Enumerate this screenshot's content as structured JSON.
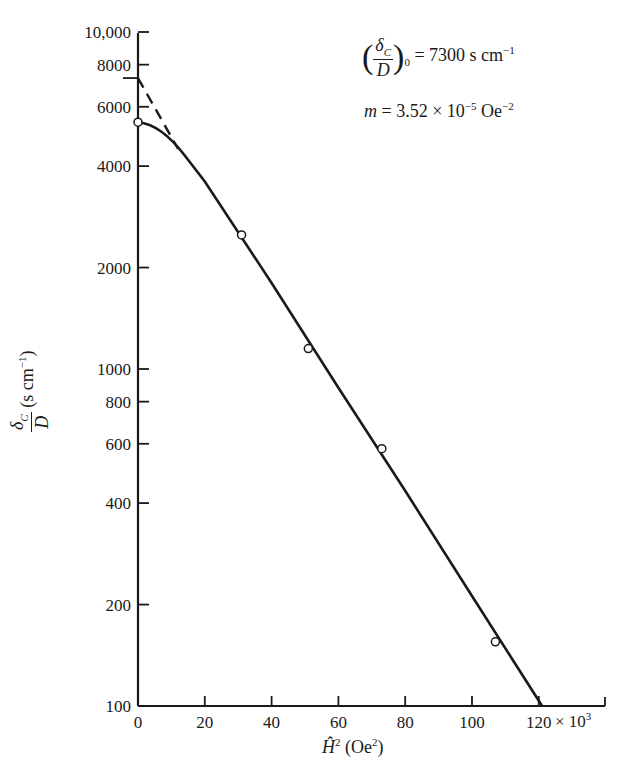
{
  "chart_data": {
    "type": "scatter",
    "title": "",
    "xlabel": "Ĥ² (Oe²)",
    "xlabel_multiplier": "× 10³",
    "ylabel": "δ_C / D (s cm⁻¹)",
    "y_scale": "log",
    "xlim": [
      0,
      140
    ],
    "ylim": [
      100,
      10000
    ],
    "grid": false,
    "x_ticks": [
      0,
      20,
      40,
      60,
      80,
      100,
      120
    ],
    "x_tick_labels": [
      "0",
      "20",
      "40",
      "60",
      "80",
      "100",
      "120"
    ],
    "y_ticks": [
      100,
      200,
      400,
      600,
      800,
      1000,
      2000,
      4000,
      6000,
      8000,
      10000
    ],
    "y_tick_labels": [
      "100",
      "200",
      "400",
      "600",
      "800",
      "1000",
      "2000",
      "4000",
      "6000",
      "8000",
      "10,000"
    ],
    "series": [
      {
        "name": "measured",
        "kind": "points",
        "marker": "open-circle",
        "x": [
          0,
          31,
          51,
          73,
          107
        ],
        "y": [
          5400,
          2500,
          1150,
          580,
          155
        ]
      },
      {
        "name": "fit",
        "kind": "line",
        "style": "solid",
        "x": [
          0,
          4,
          8,
          12,
          20,
          40,
          60,
          80,
          100,
          121
        ],
        "y": [
          5400,
          5200,
          4900,
          4500,
          3600,
          1800,
          880,
          435,
          212,
          100
        ]
      },
      {
        "name": "extrapolation",
        "kind": "line",
        "style": "dashed",
        "x": [
          0,
          12
        ],
        "y": [
          7300,
          4500
        ]
      }
    ],
    "annotations": [
      {
        "text": "(δ_C/D)₀ = 7300 s cm⁻¹"
      },
      {
        "text": "m = 3.52 × 10⁻⁵ Oe⁻²"
      }
    ]
  },
  "labels": {
    "annot1_num": "δ",
    "annot1_num_sub": "C",
    "annot1_den": "D",
    "annot1_outer_sub": "0",
    "annot1_rhs": "= 7300 s cm",
    "annot1_rhs_sup": "−1",
    "annot2_m": "m",
    "annot2_rhs": " = 3.52 × 10",
    "annot2_exp": "−5",
    "annot2_unit": " Oe",
    "annot2_unit_exp": "−2",
    "ylabel_num": "δ",
    "ylabel_num_sub": "C",
    "ylabel_den": "D",
    "ylabel_unit": " (s cm",
    "ylabel_unit_sup": "−1",
    "ylabel_close": ")",
    "xlabel_var": "Ĥ",
    "xlabel_sup": "2",
    "xlabel_unit": " (Oe",
    "xlabel_unit_sup": "2",
    "xlabel_close": ")",
    "mult": "× 10",
    "mult_sup": "3"
  },
  "layout": {
    "x0_px": 138,
    "x_px_per_unit": 3.34,
    "y100_px": 706,
    "y_px_per_decade": 337,
    "x_axis_end_px": 605,
    "y_axis_top_px": 33
  }
}
